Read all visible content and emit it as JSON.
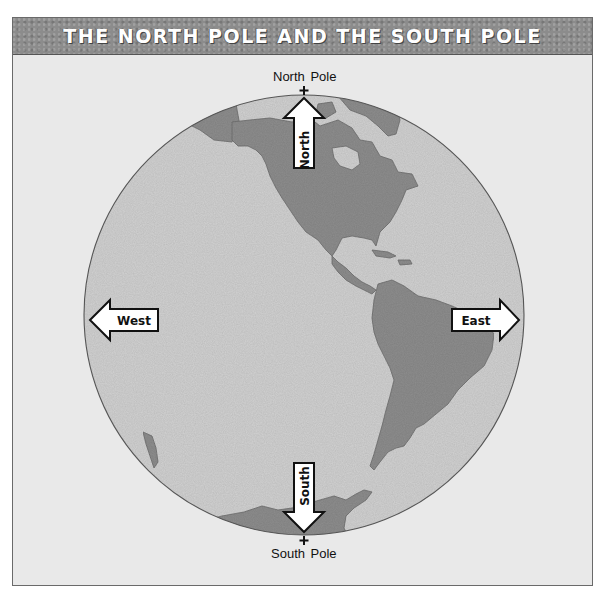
{
  "title": "THE NORTH POLE AND THE SOUTH POLE",
  "poles": {
    "north": "North Pole",
    "south": "South Pole"
  },
  "directions": {
    "north": "North",
    "south": "South",
    "east": "East",
    "west": "West"
  },
  "colors": {
    "ocean": "#d0d0d0",
    "land": "#8f8f8f",
    "background": "#e9e9e9",
    "title_bar": "#8c8c8c",
    "arrow_fill": "#ffffff",
    "outline": "#222222"
  },
  "globe": {
    "center_x": 304,
    "center_y": 315,
    "radius": 220,
    "regions_shown": [
      "North America",
      "Central America",
      "South America",
      "Antarctica",
      "Greenland"
    ]
  }
}
